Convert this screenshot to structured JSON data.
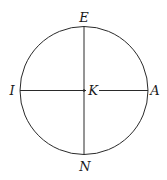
{
  "diagram": {
    "type": "circle-with-perpendicular-diameters",
    "center": {
      "label": "K",
      "x": 84,
      "y": 90.5
    },
    "radius": 64,
    "stroke_color": "#2a2a2a",
    "points": [
      {
        "label": "E",
        "position": "top"
      },
      {
        "label": "I",
        "position": "left"
      },
      {
        "label": "K",
        "position": "center"
      },
      {
        "label": "A",
        "position": "right"
      },
      {
        "label": "N",
        "position": "bottom"
      }
    ]
  }
}
